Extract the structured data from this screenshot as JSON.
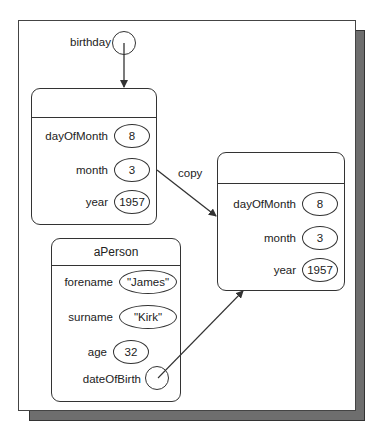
{
  "diagram": {
    "variable": {
      "label": "birthday"
    },
    "copy_label": "copy",
    "date_original": {
      "title": "",
      "fields": [
        {
          "name": "dayOfMonth",
          "value": "8"
        },
        {
          "name": "month",
          "value": "3"
        },
        {
          "name": "year",
          "value": "1957"
        }
      ]
    },
    "date_copy": {
      "title": "",
      "fields": [
        {
          "name": "dayOfMonth",
          "value": "8"
        },
        {
          "name": "month",
          "value": "3"
        },
        {
          "name": "year",
          "value": "1957"
        }
      ]
    },
    "person": {
      "title": "aPerson",
      "fields": [
        {
          "name": "forename",
          "value": "\"James\""
        },
        {
          "name": "surname",
          "value": "\"Kirk\""
        },
        {
          "name": "age",
          "value": "32"
        },
        {
          "name": "dateOfBirth",
          "value": ""
        }
      ]
    },
    "colors": {
      "line": "#333333",
      "shadow": "#6e6e6e",
      "background": "#ffffff"
    }
  }
}
